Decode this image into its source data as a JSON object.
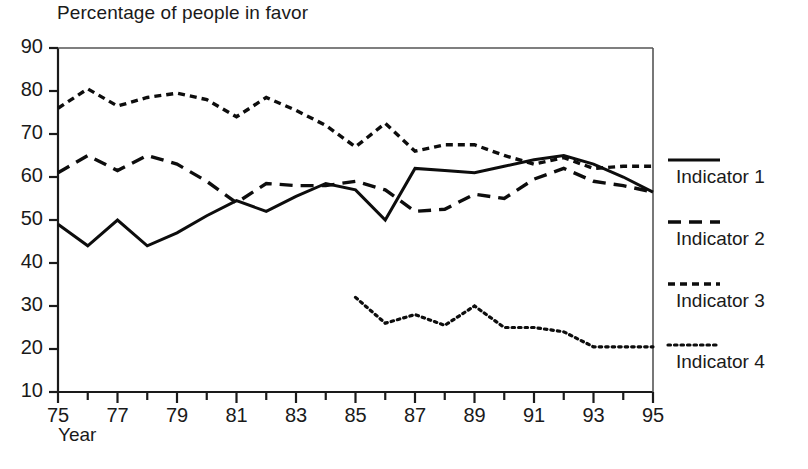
{
  "chart_data": {
    "type": "line",
    "title": "Percentage of people in favor",
    "xlabel": "Year",
    "ylabel": "",
    "xlim": [
      75,
      95
    ],
    "ylim": [
      10,
      90
    ],
    "grid": false,
    "legend_position": "right",
    "x": [
      75,
      76,
      77,
      78,
      79,
      80,
      81,
      82,
      83,
      84,
      85,
      86,
      87,
      88,
      89,
      90,
      91,
      92,
      93,
      94,
      95
    ],
    "xticks": [
      75,
      77,
      79,
      81,
      83,
      85,
      87,
      89,
      91,
      93,
      95
    ],
    "xtick_labels": [
      "75",
      "77",
      "79",
      "81",
      "83",
      "85",
      "87",
      "89",
      "91",
      "93",
      "95"
    ],
    "yticks": [
      10,
      20,
      30,
      40,
      50,
      60,
      70,
      80,
      90
    ],
    "ytick_labels": [
      "10",
      "20",
      "30",
      "40",
      "50",
      "60",
      "70",
      "80",
      "90"
    ],
    "series": [
      {
        "name": "Indicator 1",
        "style": "solid",
        "x": [
          75,
          76,
          77,
          78,
          79,
          80,
          81,
          82,
          83,
          84,
          85,
          86,
          87,
          88,
          89,
          90,
          91,
          92,
          93,
          94,
          95
        ],
        "values": [
          49,
          44,
          50,
          44,
          47,
          51,
          54.5,
          52,
          55.5,
          58.5,
          57,
          50,
          62,
          61.5,
          61,
          62.5,
          64,
          65,
          63,
          60,
          56.5
        ]
      },
      {
        "name": "Indicator 2",
        "style": "dashed",
        "x": [
          75,
          76,
          77,
          78,
          79,
          80,
          81,
          82,
          83,
          84,
          85,
          86,
          87,
          88,
          89,
          90,
          91,
          92,
          93,
          94,
          95
        ],
        "values": [
          61,
          65,
          61.5,
          65,
          63,
          59,
          54,
          58.5,
          58,
          58,
          59,
          57,
          52,
          52.5,
          56,
          55,
          59.5,
          62,
          59,
          58,
          56.5
        ]
      },
      {
        "name": "Indicator 3",
        "style": "dotted-dash",
        "x": [
          75,
          76,
          77,
          78,
          79,
          80,
          81,
          82,
          83,
          84,
          85,
          86,
          87,
          88,
          89,
          90,
          91,
          92,
          93,
          94,
          95
        ],
        "values": [
          76,
          80.5,
          76.5,
          78.5,
          79.5,
          78,
          74,
          78.5,
          75.5,
          72,
          67,
          72.5,
          66,
          67.5,
          67.5,
          65,
          63,
          64.5,
          62,
          62.5,
          62.5
        ]
      },
      {
        "name": "Indicator 4",
        "style": "dotted",
        "x": [
          85,
          86,
          87,
          88,
          89,
          90,
          91,
          92,
          93,
          94,
          95
        ],
        "values": [
          32,
          26,
          28,
          25.5,
          30,
          25,
          25,
          24,
          20.5,
          20.5,
          20.5
        ]
      }
    ]
  },
  "legend": {
    "entries": [
      {
        "label": "Indicator 1",
        "style": "solid"
      },
      {
        "label": "Indicator 2",
        "style": "dashed"
      },
      {
        "label": "Indicator 3",
        "style": "dotted-dash"
      },
      {
        "label": "Indicator 4",
        "style": "dotted"
      }
    ]
  }
}
